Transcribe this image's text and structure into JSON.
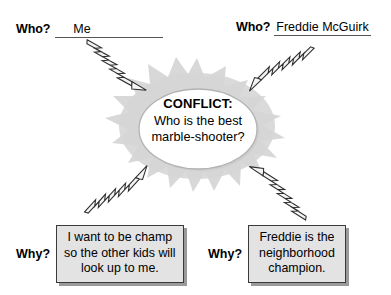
{
  "diagram": {
    "colors": {
      "background": "#ffffff",
      "text": "#000000",
      "starburst": "#d4d4d4",
      "oval_fill": "#ffffff",
      "oval_stroke": "#b0b0b0",
      "box_fill": "#e3e3e3",
      "box_border": "#3a3a3a",
      "box_shadow": "#9a9a9a",
      "bolt_fill": "#f2f2f2",
      "bolt_stroke": "#333333",
      "rule_line": "#555555"
    }
  },
  "who_left": {
    "label": "Who?",
    "value": "Me"
  },
  "who_right": {
    "label": "Who?",
    "value": "Freddie McGuirk"
  },
  "conflict": {
    "title": "CONFLICT:",
    "question_line1": "Who is the best",
    "question_line2": "marble-shooter?"
  },
  "why_left": {
    "label": "Why?",
    "reason_line1": "I want to be champ",
    "reason_line2": "so the other kids will",
    "reason_line3": "look up to me."
  },
  "why_right": {
    "label": "Why?",
    "reason_line1": "Freddie is the",
    "reason_line2": "neighborhood",
    "reason_line3": "champion."
  },
  "connectors": [
    {
      "name": "bolt-top-left",
      "from": "who_left",
      "to": "conflict"
    },
    {
      "name": "bolt-top-right",
      "from": "who_right",
      "to": "conflict"
    },
    {
      "name": "bolt-bottom-left",
      "from": "conflict",
      "to": "why_left"
    },
    {
      "name": "bolt-bottom-right",
      "from": "conflict",
      "to": "why_right"
    }
  ]
}
